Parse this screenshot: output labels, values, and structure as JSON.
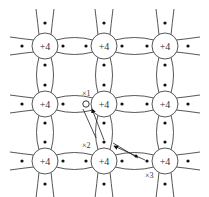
{
  "diagram": {
    "title": "",
    "ion_label": "+4",
    "grid": {
      "xs": [
        45,
        104,
        165
      ],
      "ys": [
        46,
        104,
        161
      ],
      "radius": 13
    },
    "hole": {
      "x": 86,
      "y": 104
    },
    "labels": [
      {
        "text": "×1",
        "x": 82,
        "y": 96
      },
      {
        "text": "×2",
        "x": 82,
        "y": 148
      },
      {
        "text": "×3",
        "x": 145,
        "y": 178
      }
    ],
    "colors": {
      "stroke": "#444444",
      "dot": "#111111",
      "background": "#ffffff"
    }
  }
}
